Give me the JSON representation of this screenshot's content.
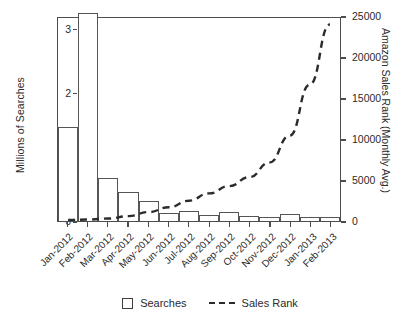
{
  "chart_data": {
    "type": "bar",
    "title": "",
    "xlabel": "",
    "ylabel": "Millions of Searches",
    "y2label": "Amazon Sales Rank (Monthly Avg.)",
    "grid": false,
    "legend_position": "bottom-center",
    "categories": [
      "Jan-2012",
      "Feb-2012",
      "Mar-2012",
      "Apr-2012",
      "May-2012",
      "Jun-2012",
      "Jul-2012",
      "Aug-2012",
      "Sep-2012",
      "Oct-2012",
      "Nov-2012",
      "Dec-2012",
      "Jan-2013",
      "Feb-2013"
    ],
    "ylim": [
      0,
      3.2
    ],
    "yticks": [
      0,
      1,
      2,
      3
    ],
    "ytick_labels": [
      "0",
      "1",
      "2",
      "3"
    ],
    "y2lim": [
      0,
      25000
    ],
    "y2ticks": [
      0,
      5000,
      10000,
      15000,
      20000,
      25000
    ],
    "y2tick_labels": [
      "0",
      "5000",
      "10000",
      "15000",
      "20000",
      "25000"
    ],
    "series": [
      {
        "name": "Searches",
        "type": "bar",
        "axis": "left",
        "units": "millions",
        "values": [
          1.47,
          3.24,
          0.67,
          0.45,
          0.32,
          0.12,
          0.15,
          0.09,
          0.14,
          0.08,
          0.07,
          0.11,
          0.06,
          0.06
        ]
      },
      {
        "name": "Sales Rank",
        "type": "line",
        "style": "dashed",
        "axis": "right",
        "units": "rank",
        "values": [
          120,
          180,
          300,
          600,
          1100,
          1700,
          2500,
          3400,
          4300,
          5400,
          7200,
          10500,
          16800,
          24200
        ]
      }
    ]
  },
  "legend": {
    "items": [
      {
        "label": "Searches",
        "marker": "open-square"
      },
      {
        "label": "Sales Rank",
        "marker": "dashed-line"
      }
    ]
  },
  "colors": {
    "axis": "#4d4d4d",
    "bar_stroke": "#555555",
    "line": "#2b2b2b",
    "background": "#ffffff"
  }
}
